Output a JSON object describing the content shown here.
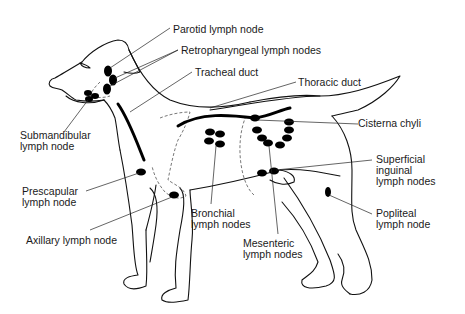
{
  "diagram": {
    "colors": {
      "line": "#111111",
      "node": "#000000",
      "text": "#1a1a1a",
      "background": "#ffffff"
    },
    "labels": {
      "parotid": [
        "Parotid lymph node"
      ],
      "retropharyngeal": [
        "Retropharyngeal lymph nodes"
      ],
      "tracheal_duct": [
        "Tracheal duct"
      ],
      "thoracic_duct": [
        "Thoracic duct"
      ],
      "submandibular": [
        "Submandibular",
        "lymph node"
      ],
      "cisterna_chyli": [
        "Cisterna chyli"
      ],
      "superficial_inguinal": [
        "Superficial",
        "inguinal",
        "lymph nodes"
      ],
      "prescapular": [
        "Prescapular",
        "lymph node"
      ],
      "axillary": [
        "Axillary lymph node"
      ],
      "bronchial": [
        "Bronchial",
        "lymph nodes"
      ],
      "popliteal": [
        "Popliteal",
        "lymph node"
      ],
      "mesenteric": [
        "Mesenteric",
        "lymph nodes"
      ]
    }
  }
}
